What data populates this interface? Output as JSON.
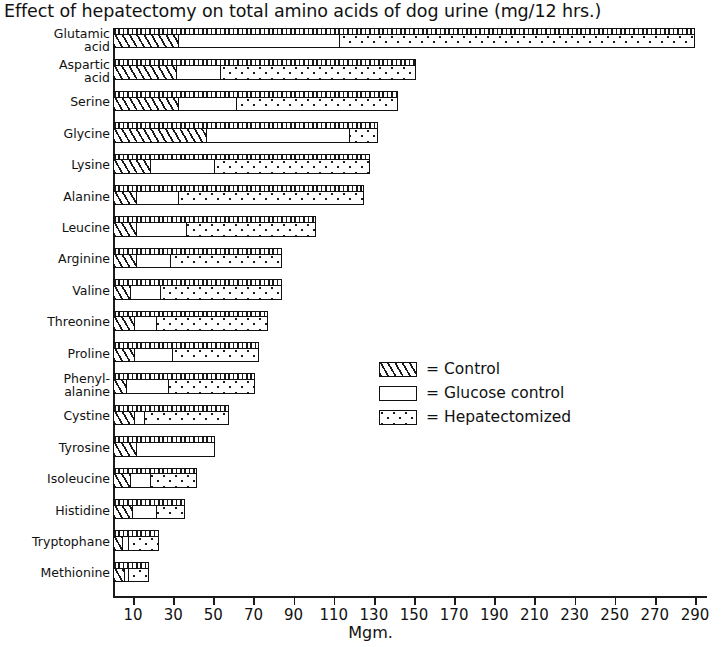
{
  "title": "Effect of hepatectomy on total amino acids of dog urine (mg/12 hrs.)",
  "axis": {
    "x_title": "Mgm.",
    "ticks": [
      10,
      30,
      50,
      70,
      90,
      110,
      130,
      150,
      170,
      190,
      210,
      230,
      250,
      270,
      290
    ],
    "tick_labels": [
      "10",
      "30",
      "50",
      "70",
      "90",
      "110",
      "130",
      "150",
      "170",
      "190",
      "210",
      "230",
      "250",
      "270",
      "290"
    ],
    "min": 0,
    "max": 295
  },
  "legend": {
    "equals": "=",
    "items": [
      {
        "swatch": "hatched-swatch",
        "label": "Control"
      },
      {
        "swatch": "white-swatch",
        "label": "Glucose control"
      },
      {
        "swatch": "dotted-swatch",
        "label": "Hepatectomized"
      }
    ]
  },
  "chart_data": {
    "type": "bar",
    "orientation": "horizontal",
    "title": "Effect of hepatectomy on total amino acids of dog urine (mg/12 hrs.)",
    "xlabel": "Mgm.",
    "ylabel": "",
    "xlim": [
      0,
      295
    ],
    "grid": false,
    "legend_position": "inside-right",
    "categories": [
      "Glutamic\nacid",
      "Aspartic\nacid",
      "Serine",
      "Glycine",
      "Lysine",
      "Alanine",
      "Leucine",
      "Arginine",
      "Valine",
      "Threonine",
      "Proline",
      "Phenyl-\nalanine",
      "Cystine",
      "Tyrosine",
      "Isoleucine",
      "Histidine",
      "Tryptophane",
      "Methionine"
    ],
    "series": [
      {
        "name": "Control",
        "values": [
          33,
          32,
          33,
          47,
          19,
          12,
          12,
          12,
          9,
          11,
          11,
          7,
          11,
          12,
          9,
          10,
          5,
          6
        ]
      },
      {
        "name": "Glucose control",
        "values": [
          113,
          54,
          62,
          118,
          51,
          33,
          37,
          29,
          24,
          22,
          30,
          28,
          16,
          51,
          19,
          22,
          8,
          8
        ]
      },
      {
        "name": "Hepatectomized",
        "values": [
          290,
          151,
          142,
          132,
          128,
          125,
          101,
          84,
          84,
          77,
          73,
          71,
          58,
          51,
          42,
          36,
          23,
          18
        ]
      }
    ]
  }
}
